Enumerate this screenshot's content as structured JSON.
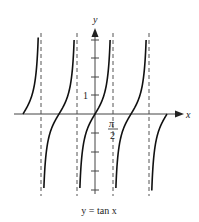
{
  "figure": {
    "caption": "y = tan x",
    "x_axis_label": "x",
    "y_axis_label": "y",
    "y_tick_label": "1",
    "x_tick_label_numerator": "π",
    "x_tick_label_denominator": "2"
  },
  "chart_data": {
    "type": "line",
    "title": "y = tan x",
    "function": "tan(x)",
    "xlabel": "x",
    "ylabel": "y",
    "labeled_ticks": {
      "x": [
        "π/2"
      ],
      "y": [
        "1"
      ]
    },
    "asymptotes_x": [
      "-3π/2",
      "-π/2",
      "π/2",
      "3π/2"
    ],
    "zeros_x": [
      "-2π",
      "-π",
      "0",
      "π",
      "2π"
    ],
    "branches": [
      {
        "x_range": [
          "-2π",
          "-3π/2"
        ]
      },
      {
        "x_range": [
          "-3π/2",
          "-π/2"
        ]
      },
      {
        "x_range": [
          "-π/2",
          "π/2"
        ]
      },
      {
        "x_range": [
          "π/2",
          "3π/2"
        ]
      },
      {
        "x_range": [
          "3π/2",
          "2π"
        ]
      }
    ],
    "y_ticks_count": 8,
    "grid": false,
    "colors": {
      "curve": "#111111",
      "axes": "#333333",
      "asymptote": "#444444"
    }
  }
}
